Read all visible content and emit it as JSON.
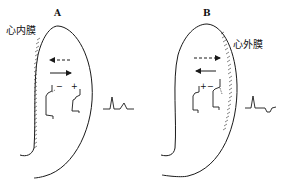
{
  "panels": [
    {
      "id": "A",
      "label": "A",
      "layer_label": "心内膜",
      "signs": {
        "left": "−",
        "right": "+"
      },
      "arrows": {
        "dashed_direction": "left",
        "solid_direction": "right"
      },
      "ecg_shape": "two upright peaks"
    },
    {
      "id": "B",
      "label": "B",
      "layer_label": "心外膜",
      "signs": {
        "left": "+",
        "right": "−"
      },
      "arrows": {
        "dashed_direction": "right",
        "solid_direction": "left"
      },
      "ecg_shape": "upright peak followed by inverted deflection"
    }
  ],
  "colors": {
    "stroke": "#1a1a1a",
    "background": "#ffffff"
  }
}
